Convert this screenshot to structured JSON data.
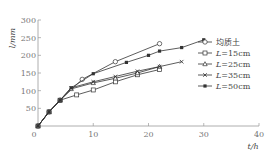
{
  "chart_data": {
    "type": "line",
    "title": "",
    "xlabel": "t/h",
    "ylabel": "l/mm",
    "xlim": [
      0,
      40
    ],
    "ylim": [
      0,
      300
    ],
    "xticks": [
      0,
      10,
      20,
      30,
      40
    ],
    "yticks": [
      50,
      100,
      150,
      200,
      250,
      300
    ],
    "grid": false,
    "legend_position": "right-middle",
    "series": [
      {
        "name": "均质土",
        "marker": "open-circle",
        "x": [
          0,
          2,
          4,
          8,
          14,
          22
        ],
        "y": [
          0,
          40,
          73,
          132,
          182,
          233
        ]
      },
      {
        "name": "L=15cm",
        "marker": "open-square",
        "x": [
          0,
          2,
          4,
          7,
          10,
          14,
          18,
          22
        ],
        "y": [
          0,
          40,
          73,
          88,
          102,
          125,
          145,
          160
        ]
      },
      {
        "name": "L=25cm",
        "marker": "open-triangle",
        "x": [
          0,
          2,
          4,
          6,
          10,
          14,
          18,
          22
        ],
        "y": [
          0,
          40,
          73,
          105,
          122,
          135,
          150,
          168
        ]
      },
      {
        "name": "L=35cm",
        "marker": "cross",
        "x": [
          0,
          2,
          4,
          6,
          10,
          14,
          18,
          22,
          26
        ],
        "y": [
          0,
          40,
          73,
          108,
          125,
          140,
          155,
          168,
          182
        ]
      },
      {
        "name": "L=50cm",
        "marker": "filled-square",
        "x": [
          0,
          2,
          4,
          6,
          10,
          16,
          20,
          22,
          26,
          30
        ],
        "y": [
          0,
          40,
          73,
          108,
          148,
          180,
          200,
          212,
          222,
          244
        ]
      }
    ]
  },
  "legend": {
    "entries": [
      "均质土",
      "L=15cm",
      "L=25cm",
      "L=35cm",
      "L=50cm"
    ]
  },
  "axes": {
    "x_title": "t/h",
    "y_title": "l/mm",
    "x_tick_labels": [
      "0",
      "10",
      "20",
      "30",
      "40"
    ],
    "y_tick_labels": [
      "50",
      "100",
      "150",
      "200",
      "250",
      "300"
    ]
  }
}
